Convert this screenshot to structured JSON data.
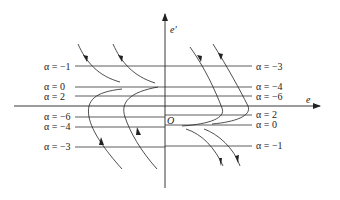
{
  "diagram": {
    "type": "phase-plane",
    "axes": {
      "horizontal_label": "e",
      "vertical_label": "e'",
      "origin_label": "O"
    },
    "left_lines": [
      {
        "label": "α = −1",
        "y": 66
      },
      {
        "label": "α = 0",
        "y": 87
      },
      {
        "label": "α = 2",
        "y": 96
      },
      {
        "label": "α = −6",
        "y": 117
      },
      {
        "label": "α = −4",
        "y": 127
      },
      {
        "label": "α = −3",
        "y": 147
      }
    ],
    "right_lines": [
      {
        "label": "α = −3",
        "y": 66
      },
      {
        "label": "α = −4",
        "y": 87
      },
      {
        "label": "α = −6",
        "y": 96
      },
      {
        "label": "α = 2",
        "y": 115
      },
      {
        "label": "α = 0",
        "y": 125
      },
      {
        "label": "α = −1",
        "y": 146
      }
    ]
  }
}
